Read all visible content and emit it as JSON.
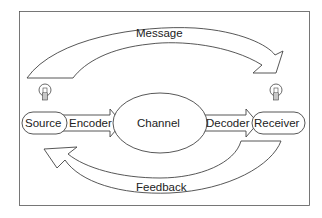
{
  "diagram": {
    "nodes": {
      "source": "Source",
      "encoder": "Encoder",
      "channel": "Channel",
      "decoder": "Decoder",
      "receiver": "Receiver"
    },
    "arrows": {
      "message": "Message",
      "feedback": "Feedback"
    },
    "icons": {
      "source_icon": "lightbulb-icon",
      "receiver_icon": "lightbulb-icon"
    },
    "colors": {
      "stroke": "#444444",
      "text": "#222222",
      "background": "#ffffff"
    }
  }
}
